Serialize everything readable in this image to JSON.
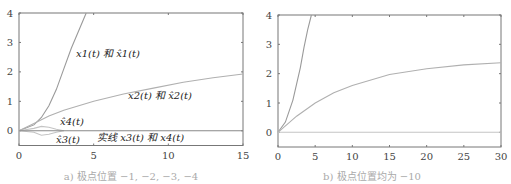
{
  "chart_data": [
    {
      "type": "line",
      "title": "",
      "caption": "a) 极点位置 −1, −2, −3, −4",
      "xlabel": "",
      "ylabel": "",
      "xlim": [
        0,
        15
      ],
      "ylim": [
        -0.5,
        4
      ],
      "xticks": [
        "0",
        "5",
        "10",
        "15"
      ],
      "yticks": [
        "0",
        "1",
        "2",
        "3",
        "4"
      ],
      "grid": false,
      "annotations": [
        "x1(t) 和 x̂1(t)",
        "x2(t) 和 x̂2(t)",
        "x̂4(t)",
        "x̂3(t)",
        "实线 x3(t) 和 x4(t)"
      ],
      "series": [
        {
          "name": "x1(t) and x̂1(t)",
          "x": [
            0,
            1,
            1.5,
            2,
            2.5,
            3,
            3.5,
            4,
            4.5
          ],
          "y": [
            0,
            0.2,
            0.45,
            0.85,
            1.4,
            2.1,
            2.8,
            3.4,
            4.0
          ]
        },
        {
          "name": "x2(t) and x̂2(t)",
          "x": [
            0,
            1,
            2,
            3,
            5,
            7,
            9,
            11,
            13,
            15
          ],
          "y": [
            0,
            0.25,
            0.5,
            0.7,
            1.0,
            1.25,
            1.45,
            1.65,
            1.8,
            1.93
          ]
        },
        {
          "name": "x̂4(t)",
          "x": [
            0,
            1,
            1.5,
            2,
            2.5,
            3
          ],
          "y": [
            0,
            0.08,
            0.15,
            0.12,
            0.05,
            0
          ]
        },
        {
          "name": "x̂3(t)",
          "x": [
            0,
            1,
            1.5,
            2,
            2.5,
            3
          ],
          "y": [
            0,
            -0.05,
            -0.15,
            -0.12,
            -0.05,
            0
          ]
        },
        {
          "name": "x3(t) and x4(t) (solid)",
          "x": [
            0,
            15
          ],
          "y": [
            0,
            0
          ]
        }
      ]
    },
    {
      "type": "line",
      "title": "",
      "caption": "b) 极点位置均为 −10",
      "xlabel": "",
      "ylabel": "",
      "xlim": [
        0,
        30
      ],
      "ylim": [
        -0.5,
        4
      ],
      "xticks": [
        "0",
        "5",
        "10",
        "15",
        "20",
        "25",
        "30"
      ],
      "yticks": [
        "0",
        "1",
        "2",
        "3",
        "4"
      ],
      "grid": false,
      "series": [
        {
          "name": "x1",
          "x": [
            0,
            1,
            2,
            3,
            3.5,
            4,
            4.5
          ],
          "y": [
            0,
            0.35,
            1.1,
            2.2,
            2.9,
            3.5,
            4.0
          ]
        },
        {
          "name": "x2",
          "x": [
            0,
            2.5,
            5,
            7.5,
            10,
            15,
            20,
            25,
            30
          ],
          "y": [
            0,
            0.55,
            1.0,
            1.35,
            1.6,
            1.97,
            2.17,
            2.3,
            2.37
          ]
        },
        {
          "name": "x3, x4",
          "x": [
            0,
            30
          ],
          "y": [
            0,
            0
          ]
        }
      ]
    }
  ]
}
